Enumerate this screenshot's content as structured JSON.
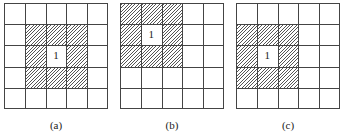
{
  "figure": {
    "grid_rows": 5,
    "grid_cols": 5,
    "panels": [
      {
        "id": "a",
        "caption": "(a)",
        "left": 4,
        "center_label": "1",
        "center_cell": [
          2,
          2
        ],
        "hatched_cells": [
          [
            1,
            1
          ],
          [
            1,
            2
          ],
          [
            1,
            3
          ],
          [
            2,
            1
          ],
          [
            2,
            3
          ],
          [
            3,
            1
          ],
          [
            3,
            2
          ],
          [
            3,
            3
          ]
        ]
      },
      {
        "id": "b",
        "caption": "(b)",
        "left": 120,
        "center_label": "1",
        "center_cell": [
          1,
          1
        ],
        "hatched_cells": [
          [
            0,
            0
          ],
          [
            0,
            1
          ],
          [
            0,
            2
          ],
          [
            1,
            0
          ],
          [
            1,
            2
          ],
          [
            2,
            0
          ],
          [
            2,
            1
          ],
          [
            2,
            2
          ]
        ]
      },
      {
        "id": "c",
        "caption": "(c)",
        "left": 236,
        "center_label": "1",
        "center_cell": [
          2,
          1
        ],
        "hatched_cells": [
          [
            1,
            0
          ],
          [
            1,
            1
          ],
          [
            1,
            2
          ],
          [
            2,
            0
          ],
          [
            2,
            2
          ],
          [
            3,
            0
          ],
          [
            3,
            1
          ],
          [
            3,
            2
          ]
        ]
      }
    ],
    "colors": {
      "grid_line": "#444444",
      "hatch": "#555555",
      "background": "#ffffff"
    }
  }
}
